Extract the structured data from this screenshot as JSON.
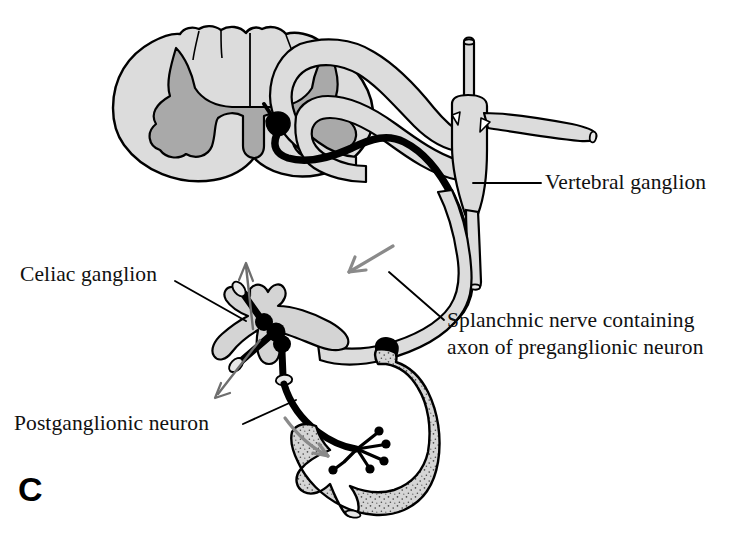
{
  "figure": {
    "panel_letter": "C",
    "background_color": "#ffffff",
    "ink_color": "#000000"
  },
  "palette": {
    "white_matter_fill": "#dcdcdc",
    "gray_matter_fill": "#a9a9a9",
    "nerve_sheath_fill": "#d8d8d8",
    "stomach_fill": "#d5d5d5",
    "stipple_color": "#4a4a4a",
    "neuron_black": "#000000",
    "flow_arrow_gray": "#8a8a8a",
    "ganglion_fill": "#d4d4d4"
  },
  "labels": [
    {
      "id": "vertebral-ganglion",
      "text": "Vertebral ganglion",
      "x": 545,
      "y": 189,
      "anchor": "start"
    },
    {
      "id": "celiac-ganglion",
      "text": "Celiac ganglion",
      "x": 20,
      "y": 281,
      "anchor": "start"
    },
    {
      "id": "splanchnic-nerve",
      "line1": "Splanchnic nerve containing",
      "line2": "axon of preganglionic neuron",
      "x": 447,
      "y": 327,
      "anchor": "start"
    },
    {
      "id": "postganglionic-neuron",
      "text": "Postganglionic neuron",
      "x": 14,
      "y": 430,
      "anchor": "start"
    }
  ],
  "structures": [
    {
      "id": "spinal-cord",
      "name": "Spinal cord cross-section",
      "description": "Transverse section with light gray white matter and darker gray butterfly-shaped central gray matter"
    },
    {
      "id": "gray-matter",
      "name": "Central gray matter",
      "description": "H-shaped dark gray horns; lateral horn houses preganglionic cell body"
    },
    {
      "id": "preganglionic-cell-body",
      "name": "Preganglionic neuron cell body",
      "description": "Solid black soma in lateral horn of gray matter"
    },
    {
      "id": "dorsal-root",
      "name": "Dorsal root and dorsal root ganglion",
      "description": "Gray looping root arcing above the ventral root"
    },
    {
      "id": "ventral-root",
      "name": "Ventral root",
      "description": "Gray sheath carrying the black preganglionic axon out of the cord"
    },
    {
      "id": "vertebral-ganglion",
      "name": "Vertebral (sympathetic chain) ganglion",
      "description": "Gray cross-shaped ganglion with vertical sympathetic trunk and lateral spinal nerve branch; axon passes through without synapsing"
    },
    {
      "id": "splanchnic-nerve",
      "name": "Splanchnic nerve",
      "description": "Long gray sheath descending from vertebral ganglion to celiac ganglion, containing the black preganglionic axon"
    },
    {
      "id": "celiac-ganglion",
      "name": "Celiac ganglion",
      "description": "Gray prevertebral ganglion where the preganglionic axon synapses on postganglionic neurons (black synaptic boutons)"
    },
    {
      "id": "postganglionic-neuron",
      "name": "Postganglionic neuron",
      "description": "Black axon leaving celiac ganglion and terminating on the stomach"
    },
    {
      "id": "stomach",
      "name": "Stomach",
      "description": "Stippled gray target organ with terminal boutons of the postganglionic axon"
    }
  ],
  "flow_arrows": [
    {
      "id": "splanchnic-flow",
      "description": "Gray arrow along splanchnic nerve indicating conduction toward the celiac ganglion"
    },
    {
      "id": "postganglionic-flow",
      "description": "Gray arrow along postganglionic axon indicating conduction toward the stomach"
    },
    {
      "id": "celiac-outflow-up",
      "description": "Gray open arrow showing additional postganglionic outflow upward from celiac ganglion"
    },
    {
      "id": "celiac-outflow-down",
      "description": "Gray open arrow showing additional postganglionic outflow downward from celiac ganglion"
    }
  ]
}
